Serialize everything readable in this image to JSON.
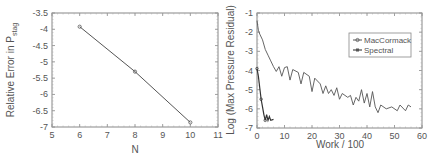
{
  "chart_data": [
    {
      "type": "line",
      "title": "",
      "xlabel": "N",
      "ylabel": "Relative Error in P",
      "ylabel_subscript": "stag",
      "xlim": [
        5,
        11
      ],
      "ylim": [
        -7,
        -3.5
      ],
      "xticks": [
        5,
        6,
        7,
        8,
        9,
        10,
        11
      ],
      "yticks": [
        -3.5,
        -4,
        -4.5,
        -5,
        -5.5,
        -6,
        -6.5,
        -7
      ],
      "grid": false,
      "series": [
        {
          "name": "error",
          "x": [
            6,
            8,
            10
          ],
          "y": [
            -3.92,
            -5.3,
            -6.86
          ]
        }
      ]
    },
    {
      "type": "line",
      "title": "",
      "xlabel": "Work / 100",
      "ylabel": "Log (Max Pressure Residual)",
      "xlim": [
        0,
        60
      ],
      "ylim": [
        -7,
        -1
      ],
      "xticks": [
        0,
        10,
        20,
        30,
        40,
        50,
        60
      ],
      "yticks": [
        -1,
        -2,
        -3,
        -4,
        -5,
        -6,
        -7
      ],
      "grid": false,
      "legend_position": "upper right",
      "series": [
        {
          "name": "MacCormack",
          "x": [
            0,
            0.5,
            1,
            2,
            3,
            4,
            5,
            6,
            7,
            8,
            9,
            10,
            11,
            12,
            13,
            15,
            16,
            17,
            19,
            20,
            21,
            23,
            24,
            25,
            26,
            27,
            28,
            29,
            30,
            31,
            33,
            34,
            35,
            36,
            37,
            38,
            39,
            40,
            41,
            42,
            43,
            44,
            45,
            47,
            49,
            51,
            52,
            54,
            55,
            56
          ],
          "y": [
            -1.4,
            -1.9,
            -2.1,
            -2.4,
            -2.9,
            -3.2,
            -3.5,
            -3.8,
            -4.05,
            -3.8,
            -4.3,
            -3.85,
            -3.8,
            -4.5,
            -3.95,
            -4.1,
            -4.7,
            -4.1,
            -4.3,
            -5.1,
            -4.4,
            -4.7,
            -5.2,
            -4.8,
            -5.2,
            -5.0,
            -5.3,
            -4.9,
            -5.5,
            -5.2,
            -5.4,
            -5.3,
            -5.8,
            -5.4,
            -5.6,
            -5.0,
            -5.7,
            -5.2,
            -5.9,
            -5.1,
            -5.9,
            -6.2,
            -5.8,
            -6.0,
            -5.9,
            -6.1,
            -5.8,
            -6.1,
            -5.8,
            -5.9
          ]
        },
        {
          "name": "Spectral",
          "x": [
            0,
            0.5,
            1,
            1.5,
            2,
            2.5,
            3,
            3.5,
            4,
            4.5,
            5,
            6
          ],
          "y": [
            -3.9,
            -4.3,
            -4.9,
            -5.5,
            -5.9,
            -6.3,
            -6.6,
            -6.3,
            -6.6,
            -6.4,
            -6.6,
            -6.55
          ]
        }
      ]
    }
  ],
  "left_chart": {
    "xlabel": "N",
    "ylabel_main": "Relative Error in P",
    "ylabel_sub": "stag",
    "xtick_labels": [
      "5",
      "6",
      "7",
      "8",
      "9",
      "10",
      "11"
    ],
    "ytick_labels": [
      "-3.5",
      "-4",
      "-4.5",
      "-5",
      "-5.5",
      "-6",
      "-6.5",
      "-7"
    ]
  },
  "right_chart": {
    "xlabel": "Work / 100",
    "ylabel": "Log (Max Pressure Residual)",
    "xtick_labels": [
      "0",
      "10",
      "20",
      "30",
      "40",
      "50",
      "60"
    ],
    "ytick_labels": [
      "-1",
      "-2",
      "-3",
      "-4",
      "-5",
      "-6",
      "-7"
    ],
    "legend": [
      "MacCormack",
      "Spectral"
    ]
  },
  "colors": {
    "line": "#555555",
    "axis": "#888888",
    "text": "#555555"
  }
}
